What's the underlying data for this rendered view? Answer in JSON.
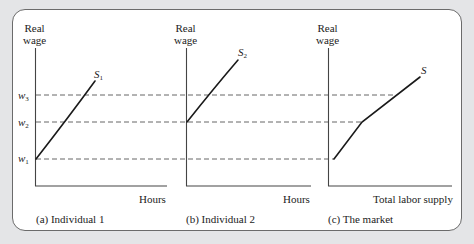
{
  "figure": {
    "panels": [
      {
        "id": "a",
        "y_axis_label_line1": "Real",
        "y_axis_label_line2": "wage",
        "x_axis_label": "Hours",
        "caption": "(a) Individual 1",
        "curve_label_main": "S",
        "curve_label_sub": "1"
      },
      {
        "id": "b",
        "y_axis_label_line1": "Real",
        "y_axis_label_line2": "wage",
        "x_axis_label": "Hours",
        "caption": "(b) Individual 2",
        "curve_label_main": "S",
        "curve_label_sub": "2"
      },
      {
        "id": "c",
        "y_axis_label_line1": "Real",
        "y_axis_label_line2": "wage",
        "x_axis_label": "Total labor supply",
        "caption": "(c) The market",
        "curve_label_main": "S",
        "curve_label_sub": ""
      }
    ],
    "wage_levels": [
      {
        "main": "w",
        "sub": "3"
      },
      {
        "main": "w",
        "sub": "2"
      },
      {
        "main": "w",
        "sub": "1"
      }
    ],
    "colors": {
      "background": "#e4e5e7",
      "card": "#ffffff",
      "line": "#222222",
      "dashed": "#666666"
    }
  }
}
